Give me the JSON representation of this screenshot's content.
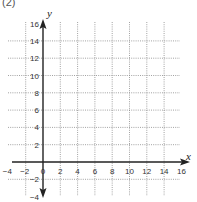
{
  "figure": {
    "label": "(2)",
    "x_axis_label": "x",
    "y_axis_label": "y"
  },
  "chart_data": {
    "type": "scatter",
    "title": "",
    "xlabel": "x",
    "ylabel": "y",
    "xlim": [
      -4,
      16
    ],
    "ylim": [
      -4,
      16
    ],
    "x_ticks": [
      -4,
      -2,
      0,
      2,
      4,
      6,
      8,
      10,
      12,
      14,
      16
    ],
    "y_ticks": [
      -4,
      -2,
      2,
      4,
      6,
      8,
      10,
      12,
      14,
      16
    ],
    "grid": true,
    "grid_style": "dotted",
    "grid_step": 2,
    "series": []
  },
  "colors": {
    "axis": "#222222",
    "grid": "#8a8a8a",
    "text": "#333333"
  }
}
